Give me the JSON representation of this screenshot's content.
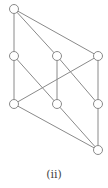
{
  "caption": "(ii)",
  "colors": {
    "edge": "#8a8a8a",
    "node_stroke": "#8a8a8a",
    "node_fill": "#ffffff"
  },
  "nodes": [
    {
      "id": "top",
      "x": 14,
      "y": 9
    },
    {
      "id": "l2",
      "x": 14,
      "y": 56
    },
    {
      "id": "m2",
      "x": 57,
      "y": 56
    },
    {
      "id": "r2",
      "x": 98,
      "y": 56
    },
    {
      "id": "l3",
      "x": 14,
      "y": 104
    },
    {
      "id": "m3",
      "x": 57,
      "y": 104
    },
    {
      "id": "r3",
      "x": 98,
      "y": 104
    },
    {
      "id": "bottom",
      "x": 98,
      "y": 150
    }
  ],
  "edges": [
    [
      "top",
      "l2"
    ],
    [
      "top",
      "m2"
    ],
    [
      "top",
      "r2"
    ],
    [
      "l2",
      "l3"
    ],
    [
      "l2",
      "m3"
    ],
    [
      "m2",
      "m3"
    ],
    [
      "m2",
      "r3"
    ],
    [
      "r2",
      "l3"
    ],
    [
      "r2",
      "r3"
    ],
    [
      "l3",
      "bottom"
    ],
    [
      "m3",
      "bottom"
    ],
    [
      "r3",
      "bottom"
    ]
  ]
}
